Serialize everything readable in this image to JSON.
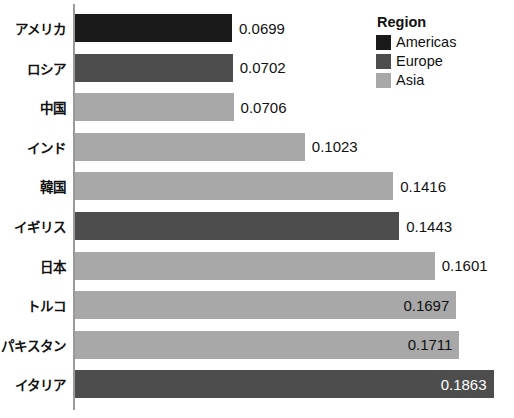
{
  "chart_data": {
    "type": "bar",
    "orientation": "horizontal",
    "title": "",
    "xlabel": "",
    "ylabel": "",
    "grid": false,
    "xlim": [
      0,
      0.1905
    ],
    "categories": [
      "アメリカ",
      "ロシア",
      "中国",
      "インド",
      "韓国",
      "イギリス",
      "日本",
      "トルコ",
      "パキスタン",
      "イタリア"
    ],
    "values": [
      0.0699,
      0.0702,
      0.0706,
      0.1023,
      0.1416,
      0.1443,
      0.1601,
      0.1697,
      0.1711,
      0.1863
    ],
    "value_labels": [
      "0.0699",
      "0.0702",
      "0.0706",
      "0.1023",
      "0.1416",
      "0.1443",
      "0.1601",
      "0.1697",
      "0.1711",
      "0.1863"
    ],
    "groups": [
      "Americas",
      "Europe",
      "Asia",
      "Asia",
      "Asia",
      "Europe",
      "Asia",
      "Asia",
      "Asia",
      "Europe"
    ],
    "label_position": [
      "outside",
      "outside",
      "outside",
      "outside",
      "outside",
      "outside",
      "outside",
      "inside",
      "inside",
      "inside"
    ],
    "label_color": [
      "#111111",
      "#111111",
      "#111111",
      "#111111",
      "#111111",
      "#111111",
      "#111111",
      "#111111",
      "#111111",
      "#ffffff"
    ],
    "bar_colors": [
      "#1a1a1a",
      "#4d4d4d",
      "#a8a8a8",
      "#a8a8a8",
      "#a8a8a8",
      "#4d4d4d",
      "#a8a8a8",
      "#a8a8a8",
      "#a8a8a8",
      "#4d4d4d"
    ],
    "legend": {
      "title": "Region",
      "position": "top-right",
      "entries": [
        {
          "label": "Americas",
          "color": "#1a1a1a"
        },
        {
          "label": "Europe",
          "color": "#4d4d4d"
        },
        {
          "label": "Asia",
          "color": "#a8a8a8"
        }
      ]
    }
  }
}
